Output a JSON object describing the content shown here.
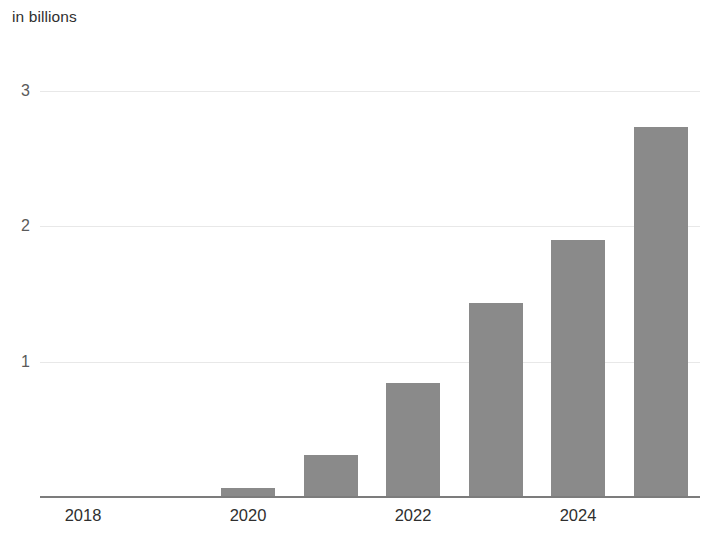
{
  "chart_data": {
    "type": "bar",
    "title": "in billions",
    "xlabel": "",
    "ylabel": "",
    "categories": [
      "2018",
      "2019",
      "2020",
      "2021",
      "2022",
      "2023",
      "2024",
      "2025"
    ],
    "values": [
      0.0,
      0.01,
      0.07,
      0.31,
      0.84,
      1.43,
      1.9,
      2.73
    ],
    "series": [
      {
        "name": "in billions",
        "values": [
          0.0,
          0.01,
          0.07,
          0.31,
          0.84,
          1.43,
          1.9,
          2.73
        ]
      }
    ],
    "ylim": [
      0,
      3.08
    ],
    "xlim_categories": [
      "2018",
      "2025"
    ],
    "y_ticks": [
      "3",
      "2",
      "1"
    ],
    "y_tick_values": [
      3,
      2,
      1
    ],
    "x_tick_labels": [
      "2018",
      "2020",
      "2022",
      "2024"
    ],
    "x_tick_categories": [
      "2018",
      "2020",
      "2022",
      "2024"
    ],
    "grid": true,
    "grid_axis": "y",
    "legend": false,
    "legend_position": "none",
    "bar_color": "#8a8a8a",
    "gridline_color": "#e8e8e8",
    "axis_color": "#7c7c7c",
    "text_color": "#2f2f2f",
    "background_color": "#ffffff",
    "annotations": []
  },
  "axis": {
    "y_title": "in billions"
  }
}
